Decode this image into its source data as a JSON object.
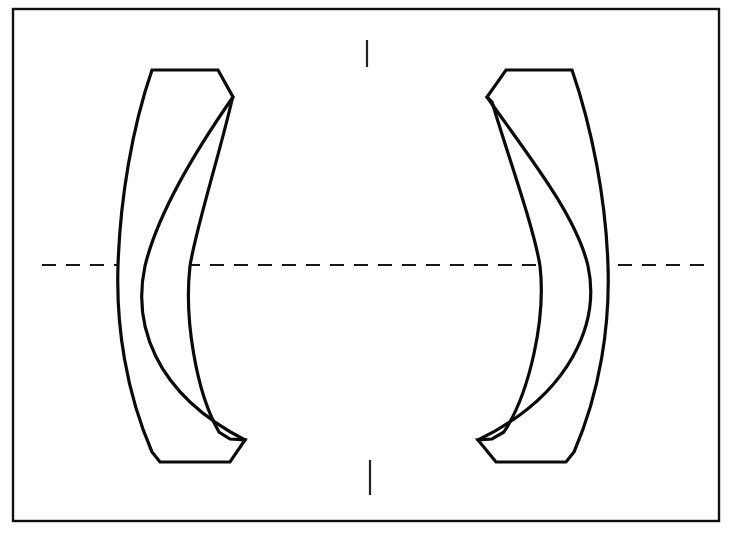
{
  "figure": {
    "subtitle": "Two-element meniscus lens pair about a common optical axis",
    "background_color": "#ffffff",
    "ink_color": "#0a0a0a",
    "width": 742,
    "height": 533
  },
  "frame": {
    "name": "drawing-border",
    "x": 13,
    "y": 9,
    "width": 706,
    "height": 512,
    "stroke_width": 2.4,
    "color": "#111111"
  },
  "optical_axis": {
    "label": "optical axis",
    "y": 265,
    "x_start": 42,
    "x_end": 711,
    "style": "dashed",
    "dash_on": 14,
    "dash_off": 10,
    "stroke_width": 2.2,
    "color": "#161616"
  },
  "center_marks": {
    "label": "vertical centre tick marks",
    "x_top": 367,
    "top_y_start": 40,
    "top_y_end": 67,
    "x_bottom": 370,
    "bottom_y_start": 460,
    "bottom_y_end": 495,
    "stroke_width": 2.2,
    "color": "#222222"
  },
  "elements": [
    {
      "id": "left-lens",
      "label": "Left meniscus element",
      "orientation": "concave toward right",
      "stroke_width": 3.2,
      "color": "#0a0a0a",
      "axis_crossings_x": [
        88,
        145,
        190
      ],
      "top_flat_y": 70,
      "bottom_flat_y": 462,
      "top_vertex": [
        233,
        97
      ],
      "bottom_vertex": [
        245,
        440
      ],
      "outline_path": "M 152 70 L 218 70 L 233 97 L 232 100 C 218 160 196 228 190 266 C 184 318 196 392 219 432 L 230 439 L 245 440 L 230 462 L 160 462 L 152 452 C 126 392 116 326 118 266 C 120 200 132 128 152 70 Z",
      "inner_curve_path": "M 233 97 C 196 150 158 212 145 266 C 133 322 152 392 245 440"
    },
    {
      "id": "right-lens",
      "label": "Right meniscus element",
      "orientation": "concave toward left",
      "stroke_width": 3.2,
      "color": "#0a0a0a",
      "axis_crossings_x": [
        537,
        588,
        640
      ],
      "top_flat_y": 70,
      "bottom_flat_y": 462,
      "top_vertex": [
        487,
        97
      ],
      "bottom_vertex": [
        478,
        440
      ],
      "outline_path": "M 572 70 L 506 70 L 487 97 L 492 102 C 510 162 534 228 540 266 C 546 318 530 392 504 432 L 492 439 L 478 440 L 496 462 L 566 462 L 574 452 C 600 392 610 326 608 266 C 606 200 592 128 572 70 Z",
      "inner_curve_path": "M 487 97 C 524 150 576 214 588 266 C 600 322 572 394 478 440"
    }
  ],
  "legend": {
    "axis_name": "optical-axis",
    "element_count": 2,
    "element_names": [
      "left-lens",
      "right-lens"
    ]
  }
}
